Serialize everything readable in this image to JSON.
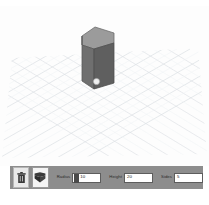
{
  "app": {
    "title": "3D shape editor viewport",
    "top_mark": "",
    "caption": ""
  },
  "viewport": {
    "name": "workplane-viewport",
    "background_color": "#fdfdfd",
    "grid": {
      "major_color": "#d2d6dc",
      "minor_color": "#e8ebee",
      "type": "isometric-perspective",
      "major_lines_left": 9,
      "major_lines_right": 11
    },
    "object": {
      "name": "pentagonal-prism",
      "top_face_color": "#9a9a9a",
      "left_face_color": "#6e6e6e",
      "right_face_color": "#5e5e5e",
      "outline_color": "#4f4f4f",
      "handle_color": "#f2f2f2",
      "handle_label": "resize-handle"
    }
  },
  "toolbar": {
    "name": "shape-parameters-toolbar",
    "background_color": "#8d8d8d",
    "buttons": [
      {
        "name": "delete-button",
        "icon": "trash-icon",
        "label": "Delete",
        "selected": false
      },
      {
        "name": "shape-tool-button",
        "icon": "prism-icon",
        "label": "Shape",
        "selected": true
      }
    ],
    "fields": [
      {
        "name": "radius-field",
        "label": "Radius",
        "value": "10",
        "has_swatch": true
      },
      {
        "name": "height-field",
        "label": "Height",
        "value": "20",
        "has_swatch": false
      },
      {
        "name": "sides-field",
        "label": "Sides",
        "value": "5",
        "has_swatch": false
      }
    ]
  }
}
